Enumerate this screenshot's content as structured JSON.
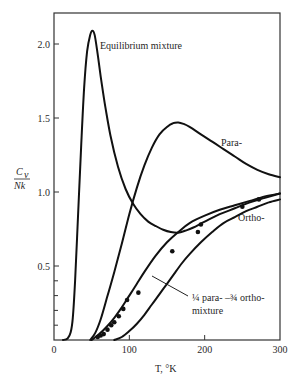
{
  "chart_data": {
    "type": "line",
    "title": "",
    "xlabel": "T, °K",
    "ylabel_num": "C",
    "ylabel_sub": "v",
    "ylabel_den": "Nk",
    "xlim": [
      0,
      300
    ],
    "ylim": [
      0,
      2.2
    ],
    "grid": false,
    "legend": "none (inline annotations)",
    "x_ticks": [
      0,
      100,
      200,
      300
    ],
    "x_tick_labels": [
      "0",
      "100",
      "200",
      "300"
    ],
    "y_ticks": [
      0.5,
      1.0,
      1.5,
      2.0
    ],
    "y_tick_labels": [
      "0.5",
      "1.0",
      "1.5",
      "2.0"
    ],
    "y_minor_ticks": [
      0.1,
      0.2,
      0.3,
      0.4
    ],
    "series": [
      {
        "name": "Equilibrium mixture",
        "x": [
          12,
          18,
          22,
          25,
          28,
          32,
          36,
          40,
          44,
          48,
          51,
          54,
          58,
          62,
          68,
          75,
          85,
          95,
          105,
          115,
          125,
          135,
          145,
          155,
          165,
          175,
          185,
          200,
          220,
          240,
          260,
          280,
          300
        ],
        "values": [
          0,
          0.01,
          0.05,
          0.15,
          0.4,
          0.85,
          1.3,
          1.7,
          1.95,
          2.06,
          2.09,
          2.06,
          1.93,
          1.78,
          1.58,
          1.38,
          1.17,
          1.02,
          0.92,
          0.85,
          0.8,
          0.77,
          0.745,
          0.73,
          0.725,
          0.74,
          0.76,
          0.8,
          0.85,
          0.89,
          0.93,
          0.96,
          0.99
        ]
      },
      {
        "name": "Para-",
        "x": [
          48,
          55,
          62,
          70,
          80,
          90,
          100,
          110,
          120,
          130,
          140,
          150,
          158,
          165,
          172,
          180,
          195,
          210,
          225,
          240,
          255,
          270,
          285,
          300
        ],
        "values": [
          0,
          0.05,
          0.14,
          0.28,
          0.46,
          0.65,
          0.85,
          1.03,
          1.18,
          1.3,
          1.39,
          1.44,
          1.465,
          1.47,
          1.46,
          1.44,
          1.39,
          1.34,
          1.29,
          1.24,
          1.19,
          1.15,
          1.12,
          1.1
        ]
      },
      {
        "name": "1/4 para- 3/4 ortho- mixture",
        "x": [
          50,
          60,
          70,
          80,
          90,
          100,
          110,
          120,
          135,
          150,
          165,
          180,
          200,
          220,
          240,
          260,
          280,
          300
        ],
        "values": [
          0,
          0.04,
          0.09,
          0.15,
          0.22,
          0.3,
          0.38,
          0.46,
          0.57,
          0.66,
          0.73,
          0.79,
          0.84,
          0.88,
          0.91,
          0.94,
          0.97,
          0.99
        ]
      },
      {
        "name": "Ortho-",
        "x": [
          80,
          90,
          100,
          110,
          120,
          130,
          140,
          150,
          160,
          170,
          180,
          195,
          210,
          225,
          240,
          255,
          270,
          285,
          300
        ],
        "values": [
          0,
          0.02,
          0.06,
          0.11,
          0.17,
          0.24,
          0.31,
          0.38,
          0.45,
          0.52,
          0.58,
          0.66,
          0.73,
          0.79,
          0.83,
          0.87,
          0.9,
          0.93,
          0.95
        ]
      }
    ],
    "experimental_points": {
      "name": "measured (1/4 para-3/4 ortho)",
      "x": [
        58,
        62,
        66,
        71,
        76,
        80,
        86,
        92,
        97,
        112,
        157,
        191,
        195,
        250,
        272
      ],
      "values": [
        0.02,
        0.03,
        0.04,
        0.07,
        0.1,
        0.12,
        0.16,
        0.21,
        0.27,
        0.32,
        0.6,
        0.73,
        0.78,
        0.9,
        0.95
      ]
    },
    "annotations": [
      {
        "text": "Equilibrium mixture",
        "x": 57,
        "y": 2.06
      },
      {
        "text": "Para-",
        "x": 195,
        "y": 1.33
      },
      {
        "text": "Ortho-",
        "x": 231,
        "y": 0.83
      },
      {
        "text": "¼ para- –¾ ortho-",
        "x": 183,
        "y": 0.29
      },
      {
        "text": "mixture",
        "x": 183,
        "y": 0.2
      }
    ]
  }
}
